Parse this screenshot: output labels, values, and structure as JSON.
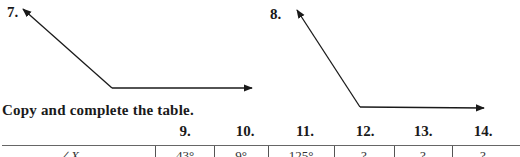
{
  "figures": [
    {
      "label": "7.",
      "description": "obtuse angle with rays pointing upper-left and right"
    },
    {
      "label": "8.",
      "description": "obtuse angle with rays pointing up-left and right"
    }
  ],
  "instruction": "Copy and complete the table.",
  "table": {
    "columns": [
      "9.",
      "10.",
      "11.",
      "12.",
      "13.",
      "14."
    ],
    "rows": [
      {
        "label": "∠X",
        "values": [
          "43°",
          "9°",
          "125°",
          "?",
          "?",
          "?"
        ]
      }
    ]
  },
  "colors": {
    "ink": "#1a1a1a",
    "rule": "#666666"
  }
}
